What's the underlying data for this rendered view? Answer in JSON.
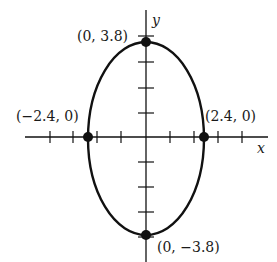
{
  "diagram": {
    "type": "ellipse-on-axes",
    "axes": {
      "x_label": "x",
      "y_label": "y"
    },
    "ellipse": {
      "semi_major_vertical": 3.8,
      "semi_minor_horizontal": 2.4,
      "center": [
        0,
        0
      ]
    },
    "points": [
      {
        "id": "top",
        "label": "(0, 3.8)",
        "x": 0,
        "y": 3.8
      },
      {
        "id": "bottom",
        "label": "(0, −3.8)",
        "x": 0,
        "y": -3.8
      },
      {
        "id": "left",
        "label": "(−2.4, 0)",
        "x": -2.4,
        "y": 0
      },
      {
        "id": "right",
        "label": "(2.4, 0)",
        "x": 2.4,
        "y": 0
      }
    ],
    "colors": {
      "stroke": "#111111",
      "background": "#ffffff"
    }
  }
}
